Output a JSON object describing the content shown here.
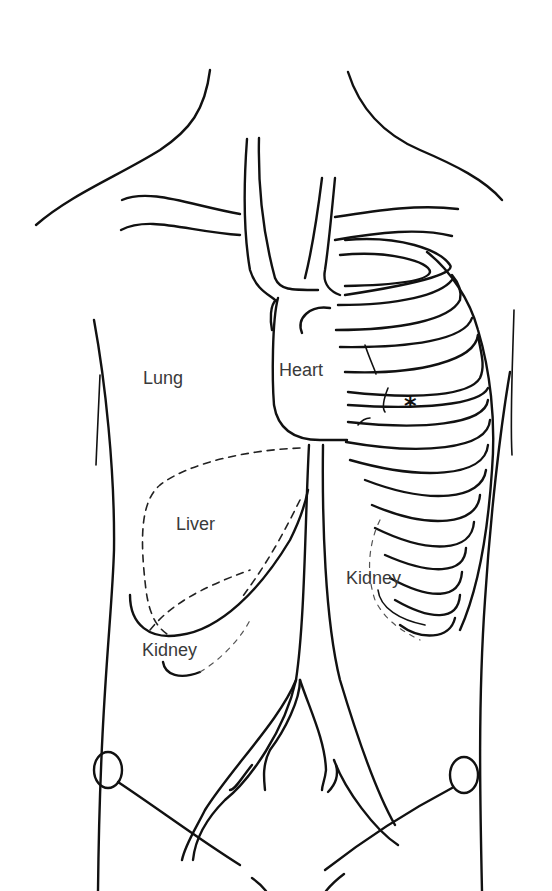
{
  "figure": {
    "header_fragment": "",
    "labels": {
      "lung": "Lung",
      "heart": "Heart",
      "liver": "Liver",
      "kidney_left": "Kidney",
      "kidney_right": "Kidney"
    },
    "marker": {
      "symbol": "*",
      "meaning": "marked location between ribs below heart"
    },
    "colors": {
      "line": "#111111",
      "label_text": "#3a3a3a",
      "background": "#ffffff"
    },
    "structures": [
      "neck-outline",
      "shoulders",
      "clavicles",
      "aortic-arch-vessels",
      "heart-outline",
      "rib-cage-left",
      "liver-outline-dashed",
      "kidneys",
      "aorta-and-iliac-arteries",
      "pelvis-outline",
      "torso-sides"
    ]
  }
}
